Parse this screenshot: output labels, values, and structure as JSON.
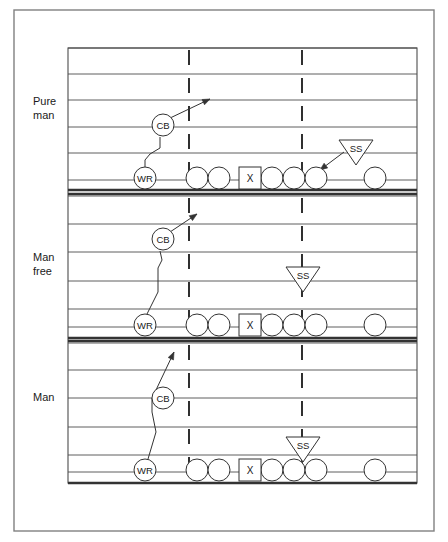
{
  "figure": {
    "type": "football-coverage-diagram",
    "border_color": "#808080",
    "line_color": "#4d4d4d",
    "thick_line_color": "#333333",
    "hash_color": "#1a1a1a",
    "shape_color": "#333333",
    "background": "#ffffff"
  },
  "panels": [
    {
      "id": "pure-man",
      "label_lines": [
        "Pure",
        "man"
      ],
      "label_x": 33,
      "label_y": 105,
      "top": 48,
      "bottom": 190,
      "yard_lines": [
        48,
        74,
        100,
        127,
        153,
        180
      ],
      "thick_lines": [
        190
      ],
      "hash_lines": [
        {
          "x": 189,
          "y1": 50,
          "y2": 178
        },
        {
          "x": 302,
          "y1": 50,
          "y2": 178
        }
      ],
      "line_of_scrimmage_y": 178,
      "offense": {
        "circles": [
          {
            "cx": 197,
            "cy": 178,
            "r": 11,
            "name": "lineman-1"
          },
          {
            "cx": 219,
            "cy": 178,
            "r": 11,
            "name": "lineman-2"
          },
          {
            "cx": 272,
            "cy": 178,
            "r": 11,
            "name": "lineman-4"
          },
          {
            "cx": 294,
            "cy": 178,
            "r": 11,
            "name": "lineman-5"
          },
          {
            "cx": 316,
            "cy": 178,
            "r": 11,
            "name": "lineman-6"
          },
          {
            "cx": 375,
            "cy": 178,
            "r": 11,
            "name": "split-receiver"
          }
        ],
        "center_box": {
          "x": 239,
          "y": 167,
          "w": 22,
          "h": 22,
          "label": "X"
        }
      },
      "wr": {
        "cx": 145,
        "cy": 178,
        "r": 11,
        "label": "WR"
      },
      "cb": {
        "cx": 163,
        "cy": 125,
        "r": 11,
        "label": "CB"
      },
      "ss": {
        "label": "SS",
        "cx": 356,
        "top_y": 140,
        "half_width": 17,
        "apex_y": 165
      },
      "cb_route": "M145,167 L145,160 L150,154 L160,148 L160,137",
      "cb_arrow": {
        "path": "M168,119 L210,99",
        "tip_x": 210,
        "tip_y": 99,
        "angle": -25
      },
      "ss_arrow": {
        "path": "M344,152 L320,170",
        "tip_x": 320,
        "tip_y": 170,
        "angle": 143
      }
    },
    {
      "id": "man-free",
      "label_lines": [
        "Man",
        "free"
      ],
      "label_x": 33,
      "label_y": 261,
      "top": 194,
      "bottom": 338,
      "yard_lines": [
        196,
        224,
        252,
        281,
        309,
        327
      ],
      "thick_lines": [
        194,
        338
      ],
      "hash_lines": [
        {
          "x": 189,
          "y1": 198,
          "y2": 325
        },
        {
          "x": 302,
          "y1": 198,
          "y2": 325
        }
      ],
      "line_of_scrimmage_y": 325,
      "offense": {
        "circles": [
          {
            "cx": 197,
            "cy": 325,
            "r": 11,
            "name": "lineman-1"
          },
          {
            "cx": 219,
            "cy": 325,
            "r": 11,
            "name": "lineman-2"
          },
          {
            "cx": 272,
            "cy": 325,
            "r": 11,
            "name": "lineman-4"
          },
          {
            "cx": 294,
            "cy": 325,
            "r": 11,
            "name": "lineman-5"
          },
          {
            "cx": 316,
            "cy": 325,
            "r": 11,
            "name": "lineman-6"
          },
          {
            "cx": 375,
            "cy": 325,
            "r": 11,
            "name": "split-receiver"
          }
        ],
        "center_box": {
          "x": 239,
          "y": 314,
          "w": 22,
          "h": 22,
          "label": "X"
        }
      },
      "wr": {
        "cx": 145,
        "cy": 325,
        "r": 11,
        "label": "WR"
      },
      "cb": {
        "cx": 163,
        "cy": 239,
        "r": 11,
        "label": "CB"
      },
      "ss": {
        "label": "SS",
        "cx": 303,
        "top_y": 267,
        "half_width": 17,
        "apex_y": 292
      },
      "cb_route": "M147,314 L158,292 L158,268 L162,260 L160,251",
      "cb_arrow": {
        "path": "M170,232 L197,214",
        "tip_x": 197,
        "tip_y": 214,
        "angle": -34
      },
      "ss_arrow": null
    },
    {
      "id": "man",
      "label_lines": [
        "Man"
      ],
      "label_x": 33,
      "label_y": 401,
      "top": 341,
      "bottom": 483,
      "yard_lines": [
        343,
        370,
        398,
        427,
        455,
        472
      ],
      "thick_lines": [
        341,
        483
      ],
      "hash_lines": [
        {
          "x": 189,
          "y1": 345,
          "y2": 470
        },
        {
          "x": 302,
          "y1": 345,
          "y2": 470
        }
      ],
      "line_of_scrimmage_y": 470,
      "offense": {
        "circles": [
          {
            "cx": 197,
            "cy": 470,
            "r": 11,
            "name": "lineman-1"
          },
          {
            "cx": 219,
            "cy": 470,
            "r": 11,
            "name": "lineman-2"
          },
          {
            "cx": 272,
            "cy": 470,
            "r": 11,
            "name": "lineman-4"
          },
          {
            "cx": 294,
            "cy": 470,
            "r": 11,
            "name": "lineman-5"
          },
          {
            "cx": 316,
            "cy": 470,
            "r": 11,
            "name": "lineman-6"
          },
          {
            "cx": 375,
            "cy": 470,
            "r": 11,
            "name": "split-receiver"
          }
        ],
        "center_box": {
          "x": 239,
          "y": 459,
          "w": 22,
          "h": 22,
          "label": "X"
        }
      },
      "wr": {
        "cx": 145,
        "cy": 470,
        "r": 11,
        "label": "WR"
      },
      "cb": {
        "cx": 163,
        "cy": 398,
        "r": 11,
        "label": "CB"
      },
      "ss": {
        "label": "SS",
        "cx": 303,
        "top_y": 437,
        "half_width": 17,
        "apex_y": 462
      },
      "cb_route": "M148,459 L156,432 L152,412 L152,398",
      "cb_arrow": {
        "path": "M156,390 L174,352",
        "tip_x": 174,
        "tip_y": 352,
        "angle": -65
      },
      "ss_arrow": null
    }
  ],
  "border": {
    "x": 14,
    "y": 10,
    "w": 420,
    "h": 521
  },
  "field_frame": {
    "x": 68,
    "y": 48,
    "w": 349,
    "h": 435
  }
}
